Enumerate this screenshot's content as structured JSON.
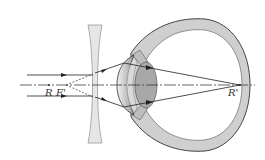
{
  "diagram": {
    "labels": {
      "far_point": "R",
      "focal_point": "F'",
      "image_point": "R'"
    },
    "components": [
      {
        "id": "concave-lens",
        "type": "diverging lens"
      },
      {
        "id": "eyeball",
        "type": "eye cross-section"
      },
      {
        "id": "crystalline-lens",
        "type": "eye lens"
      },
      {
        "id": "optical-axis",
        "type": "dash-dot axis line"
      }
    ],
    "rays": {
      "incoming": "two parallel rays",
      "virtual_extensions": "dashed lines converging back to F'",
      "refracted": "rays converge to R' on the retina"
    },
    "colors": {
      "line": "#222222",
      "lens_fill": "#e6e6e6",
      "lens_stroke": "#9a9a9a",
      "sclera_fill": "#cfcfcf",
      "eye_lens_fill": "#a8a8a8",
      "cornea_fill": "#dcdcdc"
    }
  }
}
